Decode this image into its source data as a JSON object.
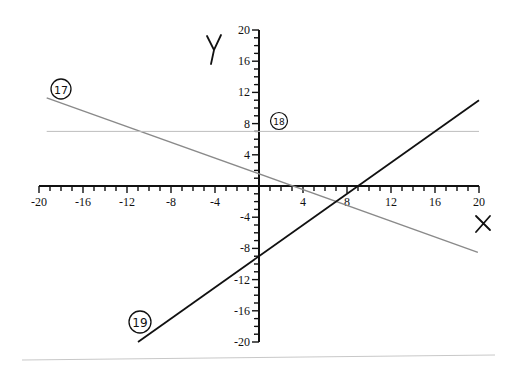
{
  "chart_data": {
    "type": "line",
    "title": "",
    "xlabel": "X",
    "ylabel": "Y",
    "xlim": [
      -20,
      20
    ],
    "ylim": [
      -20,
      20
    ],
    "x_ticks": [
      -20,
      -16,
      -12,
      -8,
      -4,
      4,
      8,
      12,
      16,
      20
    ],
    "y_ticks": [
      20,
      16,
      12,
      8,
      4,
      -4,
      -8,
      -12,
      -16,
      -20
    ],
    "minor_tick_step": 1,
    "grid": false,
    "series": [
      {
        "name": "17",
        "label": "17",
        "equation": "y = -0.5x + 1.5",
        "color": "#8a8a8a",
        "x": [
          -19.3,
          19.9
        ],
        "y": [
          11.3,
          -8.5
        ]
      },
      {
        "name": "18",
        "label": "18",
        "equation": "y = 7",
        "color": "#bdbdbd",
        "x": [
          -19.3,
          20
        ],
        "y": [
          7,
          7
        ]
      },
      {
        "name": "19",
        "label": "19",
        "equation": "y = x - 9",
        "color": "#111111",
        "x": [
          -11,
          20
        ],
        "y": [
          -20,
          11
        ]
      }
    ],
    "annotations": [
      {
        "text": "17",
        "circled": true,
        "near": [
          -18.5,
          13
        ]
      },
      {
        "text": "18",
        "circled": true,
        "near": [
          2,
          8.5
        ]
      },
      {
        "text": "19",
        "circled": true,
        "near": [
          -12.5,
          -17.5
        ]
      }
    ]
  },
  "labels": {
    "x_axis": "X",
    "y_axis": "Y",
    "x_ticks": [
      "-20",
      "-16",
      "-12",
      "-8",
      "-4",
      "4",
      "8",
      "12",
      "16",
      "20"
    ],
    "y_ticks_pos": [
      "20",
      "16",
      "12",
      "8",
      "4"
    ],
    "y_ticks_neg": [
      "-4",
      "-8",
      "-12",
      "-16",
      "-20"
    ],
    "line17": "17",
    "line18": "18",
    "line19": "19"
  }
}
